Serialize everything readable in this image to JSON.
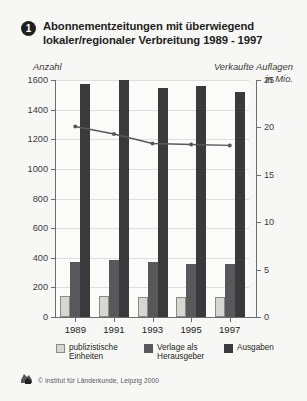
{
  "title": {
    "badge": "1",
    "text": "Abonnementzeitungen mit überwiegend lokaler/regionaler Verbreitung 1989 - 1997"
  },
  "axis": {
    "left_caption": "Anzahl",
    "right_caption": "Verkaufte Auflagen\nin Mio."
  },
  "legend": {
    "items": [
      {
        "label": "publizistische\nEinheiten",
        "color": "#d6d6d2",
        "icon": "square-swatch-icon"
      },
      {
        "label": "Verlage als\nHerausgeber",
        "color": "#58585a",
        "icon": "square-swatch-icon"
      },
      {
        "label": "Ausgaben",
        "color": "#3a3a3c",
        "icon": "square-swatch-icon"
      }
    ]
  },
  "footer": {
    "logo": "institut-fuer-laenderkunde-logo-icon",
    "text": "© Institut für Länderkunde, Leipzig 2000"
  },
  "chart_data": {
    "type": "bar",
    "title": "Abonnementzeitungen mit überwiegend lokaler/regionaler Verbreitung 1989 - 1997",
    "xlabel": "",
    "ylabel": "Anzahl",
    "y2label": "Verkaufte Auflagen in Mio.",
    "categories": [
      "1989",
      "1991",
      "1993",
      "1995",
      "1997"
    ],
    "ylim": [
      0,
      1600
    ],
    "yticks": [
      0,
      200,
      400,
      600,
      800,
      1000,
      1200,
      1400,
      1600
    ],
    "y2lim": [
      0,
      25
    ],
    "y2ticks": [
      0,
      5,
      10,
      15,
      20,
      25
    ],
    "grid": true,
    "legend_position": "bottom",
    "series": [
      {
        "name": "publizistische Einheiten",
        "type": "bar",
        "axis": "left",
        "color": "#d6d6d2",
        "values": [
          140,
          140,
          137,
          136,
          135
        ]
      },
      {
        "name": "Verlage als Herausgeber",
        "type": "bar",
        "axis": "left",
        "color": "#58585a",
        "values": [
          372,
          382,
          371,
          360,
          355
        ]
      },
      {
        "name": "Ausgaben",
        "type": "bar",
        "axis": "left",
        "color": "#3a3a3c",
        "values": [
          1575,
          1600,
          1545,
          1560,
          1520
        ]
      },
      {
        "name": "Verkaufte Auflagen in Mio.",
        "type": "line",
        "axis": "right",
        "color": "#58585a",
        "values": [
          20.1,
          19.3,
          18.3,
          18.2,
          18.1
        ]
      }
    ]
  }
}
